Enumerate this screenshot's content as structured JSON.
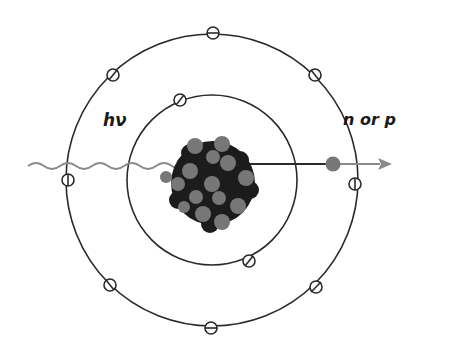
{
  "diagram": {
    "photon_label": "hν",
    "ejected_label": "n or p",
    "colors": {
      "line": "#2a2a2a",
      "photon": "#8a8a8a",
      "nucleus_dark": "#1c1c1c",
      "nucleon_gray": "#777777",
      "ejected_particle": "#777777",
      "background": "#ffffff"
    },
    "orbits": [
      {
        "name": "inner-shell",
        "radius": 86,
        "electrons": 2
      },
      {
        "name": "outer-shell",
        "radius": 146,
        "electrons": 8
      }
    ]
  }
}
